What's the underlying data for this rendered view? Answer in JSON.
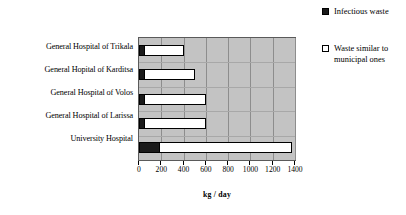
{
  "chart_data": {
    "type": "bar",
    "orientation": "horizontal",
    "stacked": true,
    "title": "",
    "xlabel": "kg / day",
    "ylabel": "",
    "xlim": [
      0,
      1400
    ],
    "xticks": [
      0,
      200,
      400,
      600,
      800,
      1000,
      1200,
      1400
    ],
    "xtick_labels": [
      "0",
      "200",
      "400",
      "600",
      "800",
      "1000",
      "1200",
      "1400"
    ],
    "grid": true,
    "grid_axis": "x",
    "legend_position": "right",
    "plot_background": "#c3c3c3",
    "categories": [
      "General Hospital of Trikala",
      "General Hopital of Karditsa",
      "General Hospital of Volos",
      "General Hospital of Larissa",
      "University Hospital"
    ],
    "series": [
      {
        "name": "Infectious waste",
        "color": "#1a1a1a",
        "values": [
          45,
          45,
          45,
          45,
          180
        ]
      },
      {
        "name": "Waste similar to municipal ones",
        "color": "#ffffff",
        "values": [
          355,
          455,
          555,
          555,
          1190
        ]
      }
    ],
    "totals": [
      400,
      500,
      600,
      600,
      1370
    ]
  },
  "legend": {
    "entries": [
      {
        "swatch": "filled",
        "label": "Infectious waste"
      },
      {
        "swatch": "hollow",
        "label": "Waste similar to municipal ones"
      }
    ]
  }
}
